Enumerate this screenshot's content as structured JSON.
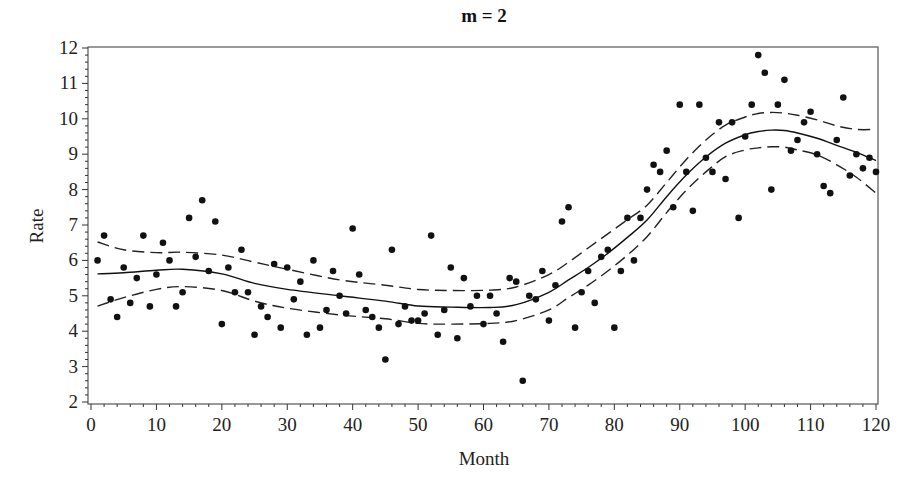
{
  "chart_data": {
    "type": "scatter",
    "title": "m = 2",
    "xlabel": "Month",
    "ylabel": "Rate",
    "xlim": [
      0,
      120
    ],
    "ylim": [
      2,
      12
    ],
    "x_ticks": [
      0,
      10,
      20,
      30,
      40,
      50,
      60,
      70,
      80,
      90,
      100,
      110,
      120
    ],
    "y_ticks": [
      2,
      3,
      4,
      5,
      6,
      7,
      8,
      9,
      10,
      11,
      12
    ],
    "x_minor_step": 2,
    "y_minor_step": 0.2,
    "grid": false,
    "legend": null,
    "series": [
      {
        "name": "Observed rate",
        "kind": "scatter",
        "x": [
          1,
          2,
          3,
          4,
          5,
          6,
          7,
          8,
          9,
          10,
          11,
          12,
          13,
          14,
          15,
          16,
          17,
          18,
          19,
          20,
          21,
          22,
          23,
          24,
          25,
          26,
          27,
          28,
          29,
          30,
          31,
          32,
          33,
          34,
          35,
          36,
          37,
          38,
          39,
          40,
          41,
          42,
          43,
          44,
          45,
          46,
          47,
          48,
          49,
          50,
          51,
          52,
          53,
          54,
          55,
          56,
          57,
          58,
          59,
          60,
          61,
          62,
          63,
          64,
          65,
          66,
          67,
          68,
          69,
          70,
          71,
          72,
          73,
          74,
          75,
          76,
          77,
          78,
          79,
          80,
          81,
          82,
          83,
          84,
          85,
          86,
          87,
          88,
          89,
          90,
          91,
          92,
          93,
          94,
          95,
          96,
          97,
          98,
          99,
          100,
          101,
          102,
          103,
          104,
          105,
          106,
          107,
          108,
          109,
          110,
          111,
          112,
          113,
          114,
          115,
          116,
          117,
          118,
          119,
          120
        ],
        "y": [
          6.0,
          6.7,
          4.9,
          4.4,
          5.8,
          4.8,
          5.5,
          6.7,
          4.7,
          5.6,
          6.5,
          6.0,
          4.7,
          5.1,
          7.2,
          6.1,
          7.7,
          5.7,
          7.1,
          4.2,
          5.8,
          5.1,
          6.3,
          5.1,
          3.9,
          4.7,
          4.4,
          5.9,
          4.1,
          5.8,
          4.9,
          5.4,
          3.9,
          6.0,
          4.1,
          4.6,
          5.7,
          5.0,
          4.5,
          6.9,
          5.6,
          4.6,
          4.4,
          4.1,
          3.2,
          6.3,
          4.2,
          4.7,
          4.3,
          4.3,
          4.5,
          6.7,
          3.9,
          4.6,
          5.8,
          3.8,
          5.5,
          4.7,
          5.0,
          4.2,
          5.0,
          4.5,
          3.7,
          5.5,
          5.4,
          2.6,
          5.0,
          4.9,
          5.7,
          4.3,
          5.3,
          7.1,
          7.5,
          4.1,
          5.1,
          5.7,
          4.8,
          6.1,
          6.3,
          4.1,
          5.7,
          7.2,
          6.0,
          7.2,
          8.0,
          8.7,
          8.5,
          9.1,
          7.5,
          10.4,
          8.5,
          7.4,
          10.4,
          8.9,
          8.5,
          9.9,
          8.3,
          9.9,
          7.2,
          9.5,
          10.4,
          11.8,
          11.3,
          8.0,
          10.4,
          11.1,
          9.1,
          9.4,
          9.9,
          10.2,
          9.0,
          8.1,
          7.9,
          9.4,
          10.6,
          8.4,
          9.0,
          8.6,
          8.9,
          8.5
        ]
      },
      {
        "name": "Fitted curve",
        "kind": "line",
        "style": "solid",
        "x": [
          1,
          5,
          10,
          14,
          20,
          25,
          30,
          38,
          45,
          50,
          55,
          61,
          65,
          70,
          73,
          76,
          79,
          82,
          85,
          88,
          91,
          94,
          97,
          100,
          102,
          104,
          106,
          108,
          111,
          114,
          117,
          120
        ],
        "y": [
          5.62,
          5.65,
          5.72,
          5.75,
          5.62,
          5.35,
          5.18,
          5.0,
          4.85,
          4.71,
          4.68,
          4.67,
          4.75,
          5.1,
          5.45,
          5.8,
          6.2,
          6.65,
          7.14,
          7.8,
          8.41,
          8.92,
          9.31,
          9.55,
          9.64,
          9.68,
          9.67,
          9.6,
          9.45,
          9.25,
          9.05,
          8.82
        ]
      },
      {
        "name": "Upper confidence band",
        "kind": "line",
        "style": "dashed",
        "x": [
          1,
          5,
          10,
          14,
          20,
          25,
          30,
          38,
          45,
          50,
          55,
          61,
          65,
          70,
          73,
          76,
          79,
          82,
          85,
          88,
          91,
          94,
          97,
          100,
          102,
          104,
          106,
          108,
          111,
          114,
          117,
          120
        ],
        "y": [
          6.52,
          6.3,
          6.22,
          6.23,
          6.15,
          5.95,
          5.75,
          5.45,
          5.3,
          5.18,
          5.15,
          5.16,
          5.25,
          5.6,
          5.95,
          6.35,
          6.75,
          7.15,
          7.56,
          8.2,
          8.85,
          9.4,
          9.82,
          10.05,
          10.15,
          10.18,
          10.16,
          10.1,
          9.97,
          9.8,
          9.7,
          9.7
        ]
      },
      {
        "name": "Lower confidence band",
        "kind": "line",
        "style": "dashed",
        "x": [
          1,
          5,
          10,
          14,
          20,
          25,
          30,
          38,
          45,
          50,
          55,
          61,
          65,
          70,
          73,
          76,
          79,
          82,
          85,
          88,
          91,
          94,
          97,
          100,
          102,
          104,
          106,
          108,
          111,
          114,
          117,
          120
        ],
        "y": [
          4.71,
          4.95,
          5.18,
          5.26,
          5.15,
          4.85,
          4.65,
          4.46,
          4.35,
          4.22,
          4.2,
          4.22,
          4.3,
          4.6,
          4.95,
          5.3,
          5.7,
          6.15,
          6.67,
          7.35,
          7.98,
          8.5,
          8.93,
          9.12,
          9.18,
          9.21,
          9.2,
          9.12,
          8.98,
          8.7,
          8.35,
          7.9
        ]
      }
    ],
    "plot_area_px": {
      "left": 88,
      "top": 47,
      "right": 878,
      "bottom": 404,
      "x0_px": 91,
      "x1_px": 876,
      "y_top_px": 48,
      "y_bottom_px": 402
    }
  }
}
